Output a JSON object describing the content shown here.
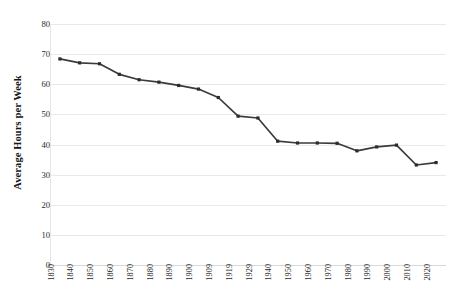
{
  "chart_data": {
    "type": "line",
    "title": "",
    "subtitle": "",
    "xlabel": "",
    "ylabel": "Average Hours per Week",
    "ylim": [
      0,
      80
    ],
    "y_ticks": [
      0,
      10,
      20,
      30,
      40,
      50,
      60,
      70,
      80
    ],
    "y_tick_labels": [
      "0",
      "10",
      "20",
      "30",
      "40",
      "50",
      "60",
      "70",
      "80"
    ],
    "grid": true,
    "grid_axis": "y",
    "legend": false,
    "legend_position": "none",
    "marker": "square",
    "line_color": "#3b3b3b",
    "marker_color": "#2b2b2b",
    "grid_color": "#e9e9e9",
    "background_color": "#ffffff",
    "categories": [
      "1830",
      "1840",
      "1850",
      "1860",
      "1870",
      "1880",
      "1890",
      "1900",
      "1909",
      "1919",
      "1929",
      "1940",
      "1950",
      "1960",
      "1970",
      "1980",
      "1990",
      "2000",
      "2010",
      "2020"
    ],
    "x": [
      1830,
      1840,
      1850,
      1860,
      1870,
      1880,
      1890,
      1900,
      1909,
      1919,
      1929,
      1940,
      1950,
      1960,
      1970,
      1980,
      1990,
      2000,
      2010,
      2020
    ],
    "values": [
      68.4,
      67.1,
      66.8,
      63.3,
      61.5,
      60.7,
      59.6,
      58.4,
      55.6,
      49.4,
      48.8,
      41.1,
      40.5,
      40.5,
      40.4,
      37.9,
      39.2,
      39.8,
      33.2,
      34.0
    ],
    "series": [
      {
        "name": "Average Hours per Week",
        "values": [
          68.4,
          67.1,
          66.8,
          63.3,
          61.5,
          60.7,
          59.6,
          58.4,
          55.6,
          49.4,
          48.8,
          41.1,
          40.5,
          40.5,
          40.4,
          37.9,
          39.2,
          39.8,
          33.2,
          34.0
        ]
      }
    ]
  }
}
